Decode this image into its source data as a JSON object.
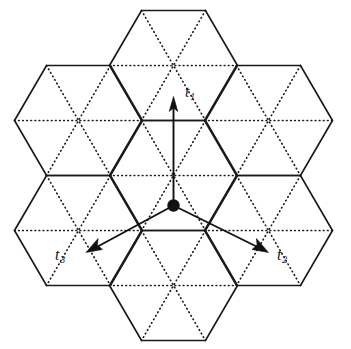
{
  "figure": {
    "type": "hexagonal-lattice-diagram",
    "background_color": "#ffffff",
    "line_color": "#1a1a1a",
    "canvas": {
      "width": 351,
      "height": 349
    }
  },
  "lattice": {
    "hex_circumradius": 64,
    "orientation": "pointy-left-right",
    "hex_centers": [
      {
        "name": "center",
        "x": 173.5,
        "y": 175.5
      },
      {
        "name": "top",
        "x": 173.5,
        "y": 65.5
      },
      {
        "name": "bottom",
        "x": 173.5,
        "y": 285.5
      },
      {
        "name": "upper-left",
        "x": 78.5,
        "y": 120.5
      },
      {
        "name": "upper-right",
        "x": 268.5,
        "y": 120.5
      },
      {
        "name": "lower-left",
        "x": 78.5,
        "y": 230.5
      },
      {
        "name": "lower-right",
        "x": 268.5,
        "y": 230.5
      }
    ]
  },
  "origin_marker": {
    "name": "lattice-origin-dot",
    "x": 173.5,
    "y": 205.5,
    "radius": 6.2,
    "color": "#111111"
  },
  "vectors": [
    {
      "id": "t1",
      "label": "t",
      "subscript": "1",
      "origin": {
        "x": 173.5,
        "y": 205.5
      },
      "tip": {
        "x": 173.5,
        "y": 97.0
      },
      "label_position": {
        "x": 185,
        "y": 84
      }
    },
    {
      "id": "t2",
      "label": "t",
      "subscript": "2",
      "origin": {
        "x": 173.5,
        "y": 205.5
      },
      "tip": {
        "x": 268.0,
        "y": 252.0
      },
      "label_position": {
        "x": 277,
        "y": 247
      }
    },
    {
      "id": "t3",
      "label": "t",
      "subscript": "3",
      "origin": {
        "x": 173.5,
        "y": 205.5
      },
      "tip": {
        "x": 86.0,
        "y": 252.0
      },
      "label_position": {
        "x": 55,
        "y": 247
      }
    }
  ]
}
